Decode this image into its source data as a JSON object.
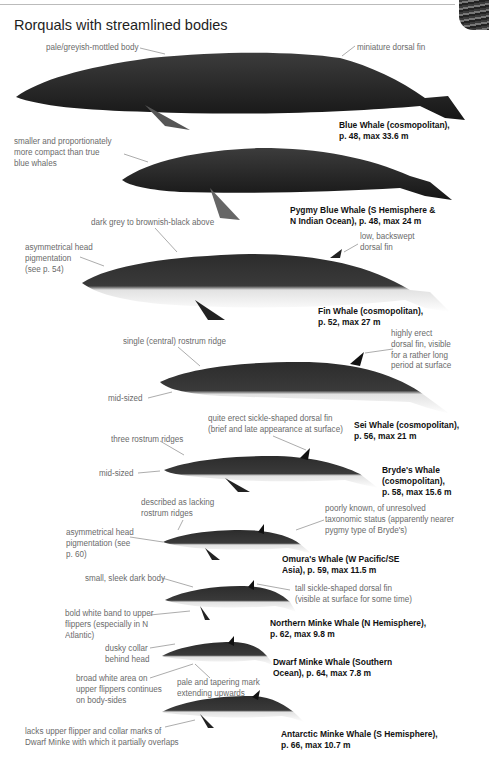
{
  "page": {
    "title": "Rorquals with streamlined bodies"
  },
  "species": [
    {
      "name_line1": "Blue Whale (cosmopolitan),",
      "name_line2": "p. 48, max 33.6 m",
      "notes": [
        "pale/greyish-mottled body",
        "miniature dorsal fin"
      ]
    },
    {
      "name_line1": "Pygmy Blue Whale (S Hemisphere &",
      "name_line2": "N Indian Ocean), p. 48, max 24 m",
      "notes": [
        "smaller and proportionately",
        "more compact than true",
        "blue whales"
      ]
    },
    {
      "name_line1": "Fin Whale (cosmopolitan),",
      "name_line2": "p. 52, max 27 m",
      "notes": [
        "dark grey to brownish-black above",
        "asymmetrical head",
        "pigmentation",
        "(see p. 54)",
        "low, backswept",
        "dorsal fin"
      ]
    },
    {
      "name_line1": "Sei Whale (cosmopolitan),",
      "name_line2": "p. 56, max 21 m",
      "notes": [
        "single (central) rostrum ridge",
        "highly erect",
        "dorsal fin, visible",
        "for a rather long",
        "period at surface",
        "mid-sized"
      ]
    },
    {
      "name_line1": "Bryde's Whale",
      "name_line2": "(cosmopolitan),",
      "name_line3": "p. 58, max 15.6 m",
      "notes": [
        "quite erect sickle-shaped dorsal fin",
        "(brief and late appearance at surface)",
        "three rostrum ridges",
        "mid-sized"
      ]
    },
    {
      "name_line1": "Omura's Whale (W Pacific/SE",
      "name_line2": "Asia), p. 59, max 11.5 m",
      "notes": [
        "described as lacking",
        "rostrum ridges",
        "asymmetrical head",
        "pigmentation (see",
        "p. 60)",
        "poorly known, of unresolved",
        "taxonomic status (apparently nearer",
        "pygmy type of Bryde's)"
      ]
    },
    {
      "name_line1": "Northern Minke Whale (N Hemisphere),",
      "name_line2": "p. 62, max 9.8 m",
      "notes": [
        "small, sleek dark body",
        "tall sickle-shaped dorsal fin",
        "(visible at surface for some time)",
        "bold white band to upper",
        "flippers (especially in N",
        "Atlantic)"
      ]
    },
    {
      "name_line1": "Dwarf Minke Whale (Southern",
      "name_line2": "Ocean), p. 64, max 7.8 m",
      "notes": [
        "dusky collar",
        "behind head",
        "broad white area on",
        "upper flippers continues",
        "on body-sides",
        "pale and tapering mark",
        "extending upwards"
      ]
    },
    {
      "name_line1": "Antarctic Minke Whale (S Hemisphere),",
      "name_line2": "p. 66, max 10.7 m",
      "notes": [
        "lacks upper flipper and collar marks of",
        "Dwarf Minke with which it partially overlaps"
      ]
    }
  ]
}
